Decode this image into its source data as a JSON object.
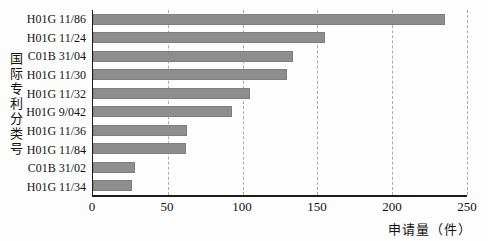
{
  "chart_data": {
    "type": "bar",
    "orientation": "horizontal",
    "categories": [
      "H01G 11/86",
      "H01G 11/24",
      "C01B 31/04",
      "H01G 11/30",
      "H01G 11/32",
      "H01G 9/042",
      "H01G 11/36",
      "H01G 11/84",
      "C01B 31/02",
      "H01G 11/34"
    ],
    "values": [
      235,
      155,
      134,
      130,
      105,
      93,
      63,
      62,
      28,
      26
    ],
    "title": "",
    "xlabel": "申请量（件）",
    "ylabel": "国际专利分类号",
    "xlim": [
      0,
      250
    ],
    "xticks": [
      0,
      50,
      100,
      150,
      200,
      250
    ],
    "grid": "vertical-dashed",
    "legend": "none"
  },
  "colors": {
    "bar": "#8d8d8d",
    "axis": "#1c1c1c",
    "gridline": "#ababab",
    "text": "#121212",
    "background": "#fdfdfd"
  }
}
